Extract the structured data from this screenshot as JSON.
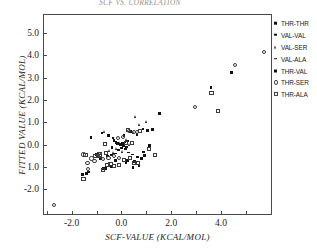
{
  "chart": {
    "type": "scatter",
    "title": "SCF VS. CORRELATION",
    "xlabel": "SCF-VALUE (KCAL/MOL)",
    "ylabel": "FITTED VALUE (KCAL/MOL)",
    "xlim": [
      -3.15,
      6.05
    ],
    "ylim": [
      -3.15,
      5.85
    ],
    "xticks": [
      -2.0,
      0.0,
      2.0,
      4.0
    ],
    "xtick_labels": [
      "-2.0",
      "0.0",
      "2.0",
      "4.0"
    ],
    "xticks_minor": [
      -3.0,
      -1.0,
      1.0,
      3.0,
      5.0,
      6.0
    ],
    "yticks": [
      5.0,
      4.0,
      3.0,
      2.0,
      1.0,
      0.0,
      -1.0,
      -2.0
    ],
    "ytick_labels": [
      "5.0",
      "4.0",
      "3.0",
      "2.0",
      "1.0",
      "0.0",
      "1.0",
      "-2.0"
    ],
    "grid": false,
    "legend_position": "right-outside"
  },
  "chart_data": {
    "type": "scatter",
    "title": "SCF VS. CORRELATION",
    "xlabel": "SCF-VALUE (KCAL/MOL)",
    "ylabel": "FITTED VALUE (KCAL/MOL)",
    "xlim": [
      -3.15,
      6.05
    ],
    "ylim": [
      -3.15,
      5.85
    ],
    "xticks": [
      -2.0,
      0.0,
      2.0,
      4.0
    ],
    "yticks": [
      -2.0,
      -1.0,
      0.0,
      1.0,
      2.0,
      3.0,
      4.0,
      5.0
    ],
    "grid": false,
    "legend_position": "right-outside",
    "series": [
      {
        "name": "THR-THR",
        "marker": "filled-square-small",
        "points": [
          [
            -0.3,
            0.18
          ],
          [
            -0.22,
            0.1
          ],
          [
            -0.16,
            0.06
          ],
          [
            -0.1,
            0.02
          ],
          [
            -0.05,
            -0.02
          ],
          [
            0.0,
            0.0
          ],
          [
            0.04,
            0.05
          ],
          [
            0.09,
            -0.06
          ],
          [
            0.14,
            0.12
          ],
          [
            0.2,
            -0.1
          ],
          [
            -0.38,
            -0.12
          ],
          [
            0.27,
            0.16
          ]
        ]
      },
      {
        "name": "VAL-VAL",
        "marker": "filled-square",
        "points": [
          [
            -1.22,
            0.32
          ],
          [
            -0.78,
            0.52
          ],
          [
            -0.52,
            0.4
          ],
          [
            -0.34,
            0.3
          ],
          [
            0.1,
            0.42
          ],
          [
            0.36,
            0.58
          ],
          [
            0.62,
            0.46
          ],
          [
            0.86,
            0.7
          ],
          [
            1.04,
            0.64
          ],
          [
            1.52,
            1.4
          ],
          [
            3.6,
            2.56
          ],
          [
            4.42,
            3.22
          ],
          [
            -1.4,
            -1.28
          ],
          [
            -1.32,
            -1.22
          ],
          [
            -0.62,
            -1.06
          ],
          [
            -0.4,
            -1.0
          ],
          [
            0.46,
            -1.02
          ],
          [
            0.7,
            -0.94
          ],
          [
            0.18,
            -0.82
          ]
        ]
      },
      {
        "name": "VAL-SER",
        "marker": "filled-triangle",
        "points": [
          [
            -0.46,
            -0.26
          ],
          [
            -0.3,
            -0.34
          ],
          [
            -0.18,
            -0.18
          ],
          [
            -0.08,
            0.08
          ],
          [
            0.06,
            -0.3
          ],
          [
            0.22,
            0.22
          ],
          [
            0.34,
            0.02
          ],
          [
            0.48,
            0.54
          ],
          [
            0.58,
            1.24
          ],
          [
            0.74,
            0.92
          ],
          [
            1.02,
            1.04
          ],
          [
            -0.66,
            0.6
          ]
        ]
      },
      {
        "name": "VAL-ALA",
        "marker": "filled-dash",
        "points": [
          [
            -0.56,
            -0.52
          ],
          [
            -0.4,
            -0.46
          ],
          [
            -0.26,
            -0.4
          ],
          [
            -0.12,
            -0.24
          ],
          [
            0.02,
            -0.14
          ],
          [
            0.16,
            -0.2
          ],
          [
            0.3,
            -0.36
          ],
          [
            0.44,
            -0.44
          ],
          [
            0.66,
            -0.56
          ],
          [
            0.9,
            -0.34
          ]
        ]
      },
      {
        "name": "THR-VAL",
        "marker": "filled-square-med",
        "points": [
          [
            -1.56,
            -1.34
          ],
          [
            -0.86,
            -0.62
          ],
          [
            -0.7,
            -1.08
          ],
          [
            -0.24,
            -0.7
          ],
          [
            0.26,
            -0.7
          ],
          [
            0.54,
            -0.74
          ],
          [
            0.8,
            -0.62
          ],
          [
            1.12,
            -0.04
          ],
          [
            1.26,
            0.7
          ],
          [
            0.92,
            -0.48
          ],
          [
            -1.0,
            -0.44
          ]
        ]
      },
      {
        "name": "THR-SER",
        "marker": "open-circle",
        "points": [
          [
            -2.72,
            -2.72
          ],
          [
            -1.52,
            -0.44
          ],
          [
            -1.36,
            -0.82
          ],
          [
            -1.34,
            -1.1
          ],
          [
            -1.2,
            -0.62
          ],
          [
            -1.08,
            -0.74
          ],
          [
            -0.92,
            -0.42
          ],
          [
            -0.74,
            -0.66
          ],
          [
            -0.52,
            -0.58
          ],
          [
            -0.3,
            -0.5
          ],
          [
            -0.14,
            0.3
          ],
          [
            0.06,
            0.34
          ],
          [
            0.3,
            0.62
          ],
          [
            0.52,
            0.58
          ],
          [
            -0.1,
            -0.6
          ],
          [
            0.62,
            0.56
          ],
          [
            2.96,
            1.68
          ],
          [
            4.58,
            3.58
          ],
          [
            5.74,
            4.16
          ]
        ]
      },
      {
        "name": "THR-ALA",
        "marker": "open-square",
        "points": [
          [
            -1.52,
            -1.54
          ],
          [
            -1.44,
            -0.48
          ],
          [
            -1.06,
            -0.52
          ],
          [
            -0.88,
            -0.5
          ],
          [
            -0.86,
            -0.44
          ],
          [
            -0.62,
            -0.38
          ],
          [
            -0.56,
            -0.92
          ],
          [
            -0.44,
            -0.86
          ],
          [
            -0.3,
            -0.96
          ],
          [
            -0.1,
            -0.9
          ],
          [
            0.12,
            -0.68
          ],
          [
            0.34,
            -0.6
          ],
          [
            0.5,
            -0.82
          ],
          [
            0.68,
            -0.84
          ],
          [
            0.74,
            0.6
          ],
          [
            0.28,
            0.64
          ],
          [
            0.2,
            0.06
          ],
          [
            1.1,
            -0.18
          ],
          [
            1.34,
            -0.46
          ],
          [
            3.62,
            2.32
          ],
          [
            3.88,
            1.5
          ],
          [
            -0.74,
            -1.14
          ],
          [
            -0.66,
            0.02
          ],
          [
            0.44,
            0.08
          ]
        ]
      }
    ]
  },
  "legend": {
    "items": [
      {
        "label": "THR-THR",
        "marker": "filled-square-small"
      },
      {
        "label": "VAL-VAL",
        "marker": "filled-square"
      },
      {
        "label": "VAL-SER",
        "marker": "filled-triangle"
      },
      {
        "label": "VAL-ALA",
        "marker": "filled-dash"
      },
      {
        "label": "THR-VAL",
        "marker": "filled-square-med"
      },
      {
        "label": "THR-SER",
        "marker": "open-circle"
      },
      {
        "label": "THR-ALA",
        "marker": "open-square"
      }
    ]
  }
}
